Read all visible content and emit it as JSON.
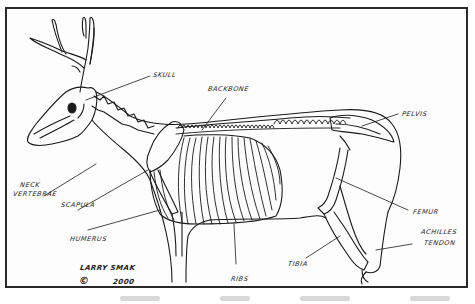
{
  "figure": {
    "line_color": "#1a1a1a",
    "frame_color": "#2a2a2a",
    "background": "#ffffff"
  },
  "labels": {
    "skull": "SKULL",
    "backbone": "BACKBONE",
    "pelvis": "PELVIS",
    "neck_vertebrae_line1": "NECK",
    "neck_vertebrae_line2": "VERTEBRAE",
    "scapula": "SCAPULA",
    "humerus": "HUMERUS",
    "ribs": "RIBS",
    "femur": "FEMUR",
    "tibia": "TIBIA",
    "achilles_tendon_line1": "ACHILLES",
    "achilles_tendon_line2": "TENDON"
  },
  "signature": {
    "artist": "LARRY SMAK",
    "copyright_symbol": "©",
    "year": "2000"
  }
}
